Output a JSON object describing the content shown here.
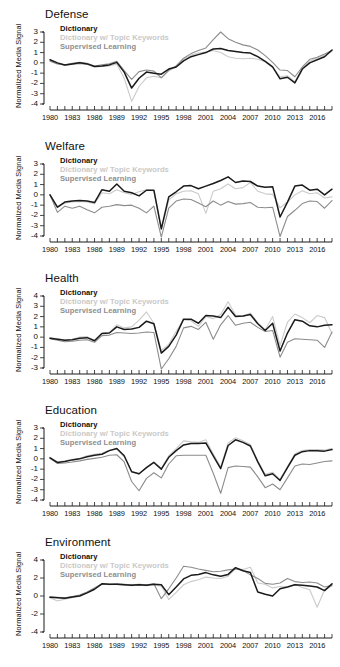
{
  "figure": {
    "ylabel": "Normalized Media Signal",
    "legend_labels": {
      "dictionary": "Dictionary",
      "keywords": "Dictionary w/ Topic Keywords",
      "supervised": "Supervised Learning"
    },
    "colors": {
      "dictionary": "#1a1a1a",
      "keywords": "#cacaca",
      "supervised": "#8c8c8c"
    },
    "xtick_labels": [
      "1980",
      "1983",
      "1986",
      "1989",
      "1992",
      "1995",
      "1998",
      "2001",
      "2004",
      "2007",
      "2010",
      "2013",
      "2016"
    ]
  },
  "chart_data": [
    {
      "type": "line",
      "title": "Defense",
      "xlabel": "",
      "ylabel": "Normalized Media Signal",
      "xlim": [
        1980,
        2018
      ],
      "ylim": [
        -4,
        3
      ],
      "yticks": [
        3,
        2,
        1,
        0,
        -1,
        -2,
        -3,
        -4
      ],
      "xticks": [
        1980,
        1983,
        1986,
        1989,
        1992,
        1995,
        1998,
        2001,
        2004,
        2007,
        2010,
        2013,
        2016
      ],
      "grid": false,
      "legend_position": "top-left",
      "x": [
        1980,
        1981,
        1982,
        1983,
        1984,
        1985,
        1986,
        1987,
        1988,
        1989,
        1990,
        1991,
        1992,
        1993,
        1994,
        1995,
        1996,
        1997,
        1998,
        1999,
        2000,
        2001,
        2002,
        2003,
        2004,
        2005,
        2006,
        2007,
        2008,
        2009,
        2010,
        2011,
        2012,
        2013,
        2014,
        2015,
        2016,
        2017,
        2018
      ],
      "series": [
        {
          "name": "Dictionary",
          "values": [
            0.3,
            0.0,
            -0.2,
            -0.1,
            0.0,
            -0.1,
            -0.35,
            -0.3,
            -0.2,
            0.05,
            -0.9,
            -2.45,
            -1.5,
            -0.9,
            -1.0,
            -1.1,
            -0.6,
            -0.4,
            0.2,
            0.6,
            0.8,
            1.0,
            1.35,
            1.4,
            1.2,
            1.1,
            1.0,
            0.95,
            0.6,
            0.15,
            -0.4,
            -1.55,
            -1.4,
            -1.95,
            -0.6,
            0.0,
            0.3,
            0.6,
            1.25
          ]
        },
        {
          "name": "Dictionary w/ Topic Keywords",
          "values": [
            0.25,
            -0.05,
            -0.25,
            -0.15,
            -0.1,
            -0.15,
            -0.4,
            -0.35,
            -0.3,
            -0.1,
            -1.5,
            -3.75,
            -2.3,
            -1.45,
            -1.3,
            -1.45,
            -0.8,
            -0.35,
            0.35,
            0.75,
            0.95,
            1.05,
            1.2,
            1.0,
            0.6,
            0.45,
            0.4,
            0.45,
            0.35,
            0.1,
            -0.45,
            -1.35,
            -1.25,
            -1.85,
            -0.5,
            0.15,
            0.5,
            0.75,
            1.1
          ]
        },
        {
          "name": "Supervised Learning",
          "values": [
            0.15,
            -0.1,
            -0.2,
            -0.05,
            0.05,
            -0.05,
            -0.3,
            -0.2,
            -0.1,
            0.15,
            -0.75,
            -1.6,
            -0.85,
            -0.7,
            -0.8,
            -1.45,
            -0.7,
            -0.3,
            0.45,
            0.9,
            1.2,
            1.45,
            2.25,
            3.0,
            2.35,
            2.0,
            1.75,
            1.6,
            1.25,
            0.7,
            0.05,
            -0.7,
            -0.75,
            -1.35,
            -0.4,
            0.35,
            0.55,
            0.85,
            1.2
          ]
        }
      ]
    },
    {
      "type": "line",
      "title": "Welfare",
      "xlabel": "",
      "ylabel": "Normalized Media Signal",
      "xlim": [
        1980,
        2018
      ],
      "ylim": [
        -4,
        3
      ],
      "yticks": [
        3,
        2,
        1,
        0,
        -1,
        -2,
        -3,
        -4
      ],
      "xticks": [
        1980,
        1983,
        1986,
        1989,
        1992,
        1995,
        1998,
        2001,
        2004,
        2007,
        2010,
        2013,
        2016
      ],
      "grid": false,
      "legend_position": "top-left",
      "x": [
        1980,
        1981,
        1982,
        1983,
        1984,
        1985,
        1986,
        1987,
        1988,
        1989,
        1990,
        1991,
        1992,
        1993,
        1994,
        1995,
        1996,
        1997,
        1998,
        1999,
        2000,
        2001,
        2002,
        2003,
        2004,
        2005,
        2006,
        2007,
        2008,
        2009,
        2010,
        2011,
        2012,
        2013,
        2014,
        2015,
        2016,
        2017,
        2018
      ],
      "series": [
        {
          "name": "Dictionary",
          "values": [
            0.0,
            -1.2,
            -0.7,
            -0.6,
            -0.55,
            -0.6,
            -0.75,
            0.5,
            0.35,
            1.05,
            0.35,
            0.2,
            -0.1,
            0.45,
            0.45,
            -3.3,
            -0.2,
            0.3,
            0.85,
            0.9,
            0.6,
            0.85,
            1.1,
            1.4,
            1.75,
            1.2,
            1.35,
            1.3,
            0.85,
            0.75,
            0.8,
            -2.15,
            -0.7,
            0.85,
            0.95,
            0.45,
            0.55,
            0.0,
            0.55
          ]
        },
        {
          "name": "Dictionary w/ Topic Keywords",
          "values": [
            0.0,
            -1.25,
            -0.8,
            -0.7,
            -0.65,
            -0.7,
            -0.85,
            0.2,
            0.1,
            0.5,
            0.2,
            0.05,
            0.3,
            0.5,
            0.4,
            -3.4,
            -0.5,
            0.1,
            0.35,
            0.4,
            0.1,
            -1.8,
            0.35,
            0.6,
            1.05,
            0.6,
            0.7,
            1.2,
            0.35,
            0.1,
            0.05,
            -1.25,
            -0.7,
            0.0,
            0.4,
            0.1,
            0.2,
            -0.3,
            -0.2
          ]
        },
        {
          "name": "Supervised Learning",
          "values": [
            0.0,
            -1.7,
            -1.1,
            -1.3,
            -1.1,
            -1.45,
            -1.75,
            -1.2,
            -1.1,
            -0.95,
            -1.05,
            -1.0,
            -1.3,
            -1.75,
            -1.1,
            -4.1,
            -1.3,
            -0.6,
            -0.4,
            -0.45,
            -0.8,
            -1.15,
            -0.6,
            -1.0,
            -0.65,
            -0.9,
            -0.85,
            -0.75,
            -1.2,
            -1.25,
            -1.2,
            -4.05,
            -2.1,
            -1.5,
            -0.85,
            -0.6,
            -0.65,
            -1.3,
            -0.55
          ]
        }
      ]
    },
    {
      "type": "line",
      "title": "Health",
      "xlabel": "",
      "ylabel": "Normalized Media Signal",
      "xlim": [
        1980,
        2018
      ],
      "ylim": [
        -3,
        4
      ],
      "yticks": [
        4,
        3,
        2,
        1,
        0,
        -1,
        -2,
        -3
      ],
      "xticks": [
        1980,
        1983,
        1986,
        1989,
        1992,
        1995,
        1998,
        2001,
        2004,
        2007,
        2010,
        2013,
        2016
      ],
      "grid": false,
      "legend_position": "top-left",
      "x": [
        1980,
        1981,
        1982,
        1983,
        1984,
        1985,
        1986,
        1987,
        1988,
        1989,
        1990,
        1991,
        1992,
        1993,
        1994,
        1995,
        1996,
        1997,
        1998,
        1999,
        2000,
        2001,
        2002,
        2003,
        2004,
        2005,
        2006,
        2007,
        2008,
        2009,
        2010,
        2011,
        2012,
        2013,
        2014,
        2015,
        2016,
        2017,
        2018
      ],
      "series": [
        {
          "name": "Dictionary",
          "values": [
            -0.1,
            -0.2,
            -0.3,
            -0.25,
            -0.1,
            -0.05,
            -0.35,
            0.35,
            0.4,
            1.0,
            0.75,
            0.8,
            0.95,
            1.55,
            1.3,
            -1.55,
            -0.9,
            0.2,
            1.75,
            1.75,
            1.35,
            2.1,
            2.05,
            1.9,
            2.9,
            2.0,
            2.05,
            2.2,
            1.3,
            0.65,
            1.35,
            -1.35,
            0.4,
            1.7,
            1.55,
            1.1,
            1.0,
            1.15,
            1.2
          ]
        },
        {
          "name": "Dictionary w/ Topic Keywords",
          "values": [
            -0.05,
            -0.15,
            -0.25,
            -0.2,
            0.0,
            0.05,
            -0.3,
            0.4,
            0.45,
            1.2,
            0.9,
            1.0,
            1.65,
            2.45,
            1.35,
            -1.3,
            -0.7,
            0.55,
            1.7,
            1.6,
            1.05,
            2.0,
            1.8,
            2.2,
            3.45,
            2.15,
            2.0,
            2.35,
            1.4,
            0.7,
            2.0,
            -0.8,
            1.45,
            2.25,
            1.9,
            1.4,
            2.1,
            1.9,
            0.35
          ]
        },
        {
          "name": "Supervised Learning",
          "values": [
            -0.15,
            -0.3,
            -0.45,
            -0.4,
            -0.3,
            -0.25,
            -0.5,
            0.15,
            0.2,
            0.45,
            0.4,
            0.35,
            0.4,
            0.5,
            0.45,
            -3.1,
            -2.1,
            -0.9,
            0.9,
            1.05,
            0.75,
            1.45,
            -0.2,
            1.2,
            2.1,
            1.15,
            1.35,
            1.45,
            0.95,
            0.55,
            0.65,
            -1.95,
            -0.5,
            -0.15,
            -0.2,
            -0.25,
            -0.3,
            -1.0,
            0.5
          ]
        }
      ]
    },
    {
      "type": "line",
      "title": "Education",
      "xlabel": "",
      "ylabel": "Normalized Media Signal",
      "xlim": [
        1980,
        2018
      ],
      "ylim": [
        -4,
        3
      ],
      "yticks": [
        3,
        2,
        1,
        0,
        -1,
        -2,
        -3,
        -4
      ],
      "xticks": [
        1980,
        1983,
        1986,
        1989,
        1992,
        1995,
        1998,
        2001,
        2004,
        2007,
        2010,
        2013,
        2016
      ],
      "grid": false,
      "legend_position": "top-left",
      "x": [
        1980,
        1981,
        1982,
        1983,
        1984,
        1985,
        1986,
        1987,
        1988,
        1989,
        1990,
        1991,
        1992,
        1993,
        1994,
        1995,
        1996,
        1997,
        1998,
        1999,
        2000,
        2001,
        2002,
        2003,
        2004,
        2005,
        2006,
        2007,
        2008,
        2009,
        2010,
        2011,
        2012,
        2013,
        2014,
        2015,
        2016,
        2017,
        2018
      ],
      "series": [
        {
          "name": "Dictionary",
          "values": [
            0.1,
            -0.35,
            -0.25,
            -0.1,
            0.0,
            0.2,
            0.35,
            0.45,
            0.8,
            1.0,
            0.3,
            -1.25,
            -1.45,
            -0.85,
            -0.35,
            -1.0,
            0.15,
            0.8,
            1.35,
            1.5,
            1.5,
            1.55,
            0.3,
            -0.95,
            1.3,
            1.85,
            1.6,
            1.25,
            -0.3,
            -1.65,
            -1.45,
            -2.1,
            -0.85,
            0.35,
            0.7,
            0.8,
            0.8,
            0.75,
            0.9
          ]
        },
        {
          "name": "Dictionary w/ Topic Keywords",
          "values": [
            0.15,
            -0.3,
            -0.2,
            -0.05,
            0.05,
            0.3,
            0.45,
            0.55,
            0.85,
            0.95,
            0.2,
            -1.2,
            -1.5,
            -0.8,
            -0.3,
            -0.95,
            0.3,
            1.0,
            1.75,
            1.65,
            1.6,
            1.85,
            0.5,
            -0.8,
            1.55,
            2.05,
            1.75,
            1.4,
            -0.2,
            -1.5,
            -1.3,
            -2.0,
            -0.75,
            0.5,
            0.8,
            0.9,
            0.9,
            0.85,
            1.0
          ]
        },
        {
          "name": "Supervised Learning",
          "values": [
            0.05,
            -0.45,
            -0.4,
            -0.3,
            -0.2,
            -0.05,
            0.05,
            0.15,
            0.35,
            0.4,
            -0.3,
            -2.2,
            -3.1,
            -1.9,
            -1.35,
            -1.85,
            -0.5,
            0.3,
            0.35,
            0.35,
            0.35,
            0.35,
            -1.4,
            -3.35,
            -0.85,
            -0.7,
            -0.75,
            -0.8,
            -1.75,
            -2.8,
            -2.45,
            -3.0,
            -1.85,
            -0.7,
            -0.5,
            -0.55,
            -0.4,
            -0.25,
            -0.2
          ]
        }
      ]
    },
    {
      "type": "line",
      "title": "Environment",
      "xlabel": "",
      "ylabel": "Normalized Media Signal",
      "xlim": [
        1980,
        2018
      ],
      "ylim": [
        -5,
        5
      ],
      "yticks": [
        4,
        2,
        0,
        -2,
        -4
      ],
      "xticks": [
        1980,
        1983,
        1986,
        1989,
        1992,
        1995,
        1998,
        2001,
        2004,
        2007,
        2010,
        2013,
        2016
      ],
      "grid": false,
      "legend_position": "top-left",
      "x": [
        1980,
        1981,
        1982,
        1983,
        1984,
        1985,
        1986,
        1987,
        1988,
        1989,
        1990,
        1991,
        1992,
        1993,
        1994,
        1995,
        1996,
        1997,
        1998,
        1999,
        2000,
        2001,
        2002,
        2003,
        2004,
        2005,
        2006,
        2007,
        2008,
        2009,
        2010,
        2011,
        2012,
        2013,
        2014,
        2015,
        2016,
        2017,
        2018
      ],
      "series": [
        {
          "name": "Dictionary",
          "values": [
            -0.15,
            -0.2,
            -0.25,
            -0.1,
            0.0,
            0.35,
            0.75,
            1.35,
            1.3,
            1.3,
            1.25,
            1.2,
            1.25,
            1.2,
            1.3,
            1.25,
            0.15,
            1.0,
            1.9,
            2.3,
            2.4,
            2.6,
            2.35,
            2.2,
            2.4,
            3.15,
            2.8,
            2.6,
            0.45,
            0.2,
            0.0,
            0.8,
            1.0,
            1.25,
            1.2,
            1.1,
            1.0,
            0.6,
            1.35
          ]
        },
        {
          "name": "Dictionary w/ Topic Keywords",
          "values": [
            -0.2,
            -0.55,
            -0.35,
            -0.2,
            0.05,
            0.4,
            0.9,
            1.35,
            1.25,
            1.3,
            1.2,
            1.15,
            1.2,
            1.15,
            1.25,
            1.1,
            -0.4,
            0.4,
            1.25,
            1.6,
            1.8,
            2.1,
            2.0,
            1.95,
            2.2,
            3.05,
            2.95,
            3.2,
            1.45,
            1.3,
            0.9,
            1.05,
            1.0,
            1.3,
            0.95,
            0.7,
            -1.25,
            0.7,
            1.1
          ]
        },
        {
          "name": "Supervised Learning",
          "values": [
            -0.1,
            -0.15,
            -0.2,
            -0.05,
            0.1,
            0.45,
            0.9,
            1.35,
            1.3,
            1.35,
            1.3,
            1.25,
            1.3,
            1.25,
            1.35,
            -0.3,
            0.8,
            2.0,
            3.3,
            3.2,
            3.0,
            2.85,
            2.7,
            2.75,
            2.9,
            3.0,
            2.85,
            2.35,
            1.95,
            1.4,
            1.3,
            1.45,
            1.95,
            1.6,
            1.5,
            1.55,
            1.45,
            1.0,
            1.2
          ]
        }
      ]
    }
  ]
}
